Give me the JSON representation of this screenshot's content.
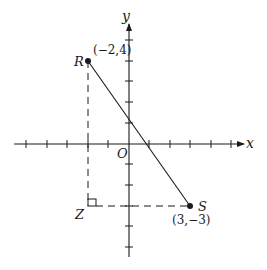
{
  "diagram": {
    "type": "coordinate-plane",
    "axes": {
      "x_label": "x",
      "y_label": "y",
      "origin_label": "O",
      "x_ticks": [
        -5,
        -4,
        -3,
        -2,
        -1,
        1,
        2,
        3,
        4,
        5
      ],
      "y_ticks": [
        -5,
        -4,
        -3,
        -2,
        -1,
        1,
        2,
        3,
        4,
        5
      ]
    },
    "points": {
      "R": {
        "name": "R",
        "coords_label": "(−2,4)",
        "x": -2,
        "y": 4
      },
      "S": {
        "name": "S",
        "coords_label": "(3,−3)",
        "x": 3,
        "y": -3
      },
      "Z": {
        "name": "Z",
        "x": -2,
        "y": -3
      }
    },
    "segments": [
      {
        "from": "R",
        "to": "S",
        "style": "solid"
      },
      {
        "from": "R",
        "to": "Z",
        "style": "dashed"
      },
      {
        "from": "Z",
        "to": "S",
        "style": "dashed"
      }
    ],
    "right_angle_at": "Z",
    "colors": {
      "ink": "#1a1a1a",
      "background": "#ffffff"
    }
  }
}
